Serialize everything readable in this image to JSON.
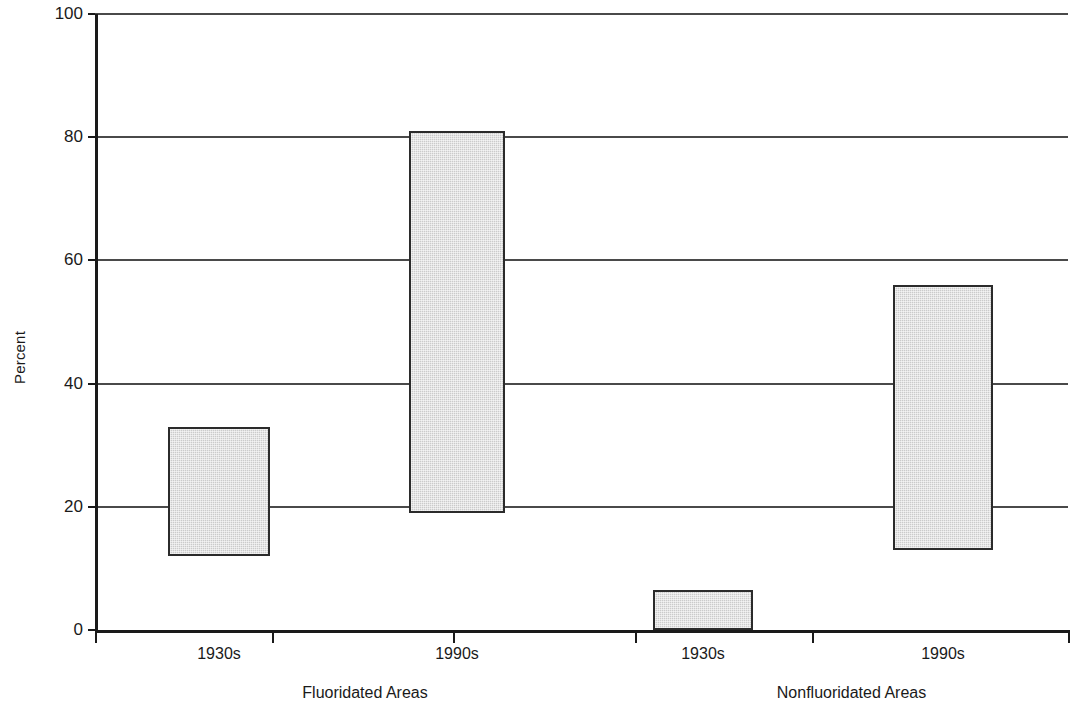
{
  "chart_data": {
    "type": "bar",
    "title": "",
    "subtitle": "",
    "xlabel": "",
    "ylabel": "Percent",
    "ylim": [
      0,
      100
    ],
    "yticks": [
      0,
      20,
      40,
      60,
      80,
      100
    ],
    "ytick_labels": [
      "0",
      "20",
      "40",
      "60",
      "80",
      "100"
    ],
    "grid": "horizontal",
    "legend": "none",
    "bar_style": "floating range bars (low to high)",
    "categories": [
      "1930s",
      "1990s",
      "1930s",
      "1990s"
    ],
    "groups": [
      {
        "label": "Fluoridated Areas",
        "categories": [
          "1930s",
          "1990s"
        ]
      },
      {
        "label": "Nonfluoridated Areas",
        "categories": [
          "1930s",
          "1990s"
        ]
      }
    ],
    "bars": [
      {
        "group": "Fluoridated Areas",
        "category": "1930s",
        "low": 12,
        "high": 33
      },
      {
        "group": "Fluoridated Areas",
        "category": "1990s",
        "low": 19,
        "high": 81
      },
      {
        "group": "Nonfluoridated Areas",
        "category": "1930s",
        "low": 0,
        "high": 6.5
      },
      {
        "group": "Nonfluoridated Areas",
        "category": "1990s",
        "low": 13,
        "high": 56
      }
    ],
    "colors": {
      "bar_fill": "#cbcbcb",
      "bar_border": "#2b2b2b",
      "gridline": "#4a4a4a",
      "axis": "#1a1a1a",
      "background": "#ffffff"
    }
  }
}
